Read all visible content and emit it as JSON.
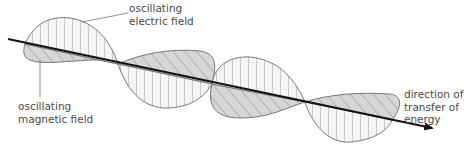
{
  "diagram": {
    "type": "electromagnetic-wave",
    "labels": {
      "electric": [
        "oscillating",
        "electric field"
      ],
      "magnetic": [
        "oscillating",
        "magnetic field"
      ],
      "direction": [
        "direction of",
        "transfer of",
        "energy"
      ]
    },
    "colors": {
      "axis": "#111111",
      "outline": "#6a6a6a",
      "hatch": "#7a7a7a",
      "electric_fill": "#f2f2f2",
      "magnetic_fill": "#d8d8d8",
      "text": "#4a4a4a"
    }
  }
}
